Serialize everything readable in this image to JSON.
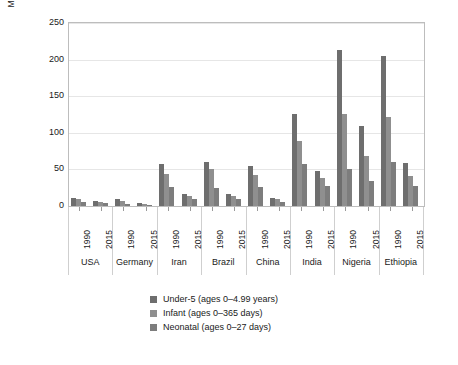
{
  "chart_data": {
    "type": "bar",
    "title": "",
    "subtitle": "",
    "xlabel": "",
    "ylabel": "Mortality rate per 1000 live births",
    "ylim": [
      0,
      250
    ],
    "yticks": [
      0,
      50,
      100,
      150,
      200,
      250
    ],
    "grid": true,
    "legend_position": "bottom",
    "grouping": "country-then-year",
    "categories": [
      "USA 1990",
      "USA 2015",
      "Germany 1990",
      "Germany 2015",
      "Iran 1990",
      "Iran 2015",
      "Brazil 1990",
      "Brazil 2015",
      "China 1990",
      "China 2015",
      "India 1990",
      "India 2015",
      "Nigeria 1990",
      "Nigeria 2015",
      "Ethiopia 1990",
      "Ethiopia 2015"
    ],
    "countries": [
      "USA",
      "Germany",
      "Iran",
      "Brazil",
      "China",
      "India",
      "Nigeria",
      "Ethiopia"
    ],
    "years": [
      "1990",
      "2015"
    ],
    "series": [
      {
        "name": "Under-5 (ages 0–4.99 years)",
        "color": "#6e6e6e",
        "values": [
          11,
          7,
          9,
          4,
          57,
          16,
          60,
          16,
          54,
          11,
          126,
          48,
          213,
          109,
          205,
          59
        ]
      },
      {
        "name": "Infant (ages 0–365 days)",
        "color": "#8f8f8f",
        "values": [
          9,
          6,
          7,
          3,
          44,
          13,
          50,
          14,
          42,
          9,
          89,
          38,
          126,
          69,
          122,
          41
        ]
      },
      {
        "name": "Neonatal (ages 0–27 days)",
        "color": "#7d7d7d",
        "values": [
          6,
          4,
          3,
          2,
          26,
          10,
          25,
          9,
          26,
          5,
          57,
          28,
          50,
          34,
          60,
          28
        ]
      }
    ]
  },
  "axis": {
    "y_title": "Mortality rate per 1000 live births",
    "y_tick_labels": [
      "250",
      "200",
      "150",
      "100",
      "50",
      "0"
    ]
  },
  "xaxis": {
    "groups": [
      {
        "country": "USA",
        "years": [
          "1990",
          "2015"
        ]
      },
      {
        "country": "Germany",
        "years": [
          "1990",
          "2015"
        ]
      },
      {
        "country": "Iran",
        "years": [
          "1990",
          "2015"
        ]
      },
      {
        "country": "Brazil",
        "years": [
          "1990",
          "2015"
        ]
      },
      {
        "country": "China",
        "years": [
          "1990",
          "2015"
        ]
      },
      {
        "country": "India",
        "years": [
          "1990",
          "2015"
        ]
      },
      {
        "country": "Nigeria",
        "years": [
          "1990",
          "2015"
        ]
      },
      {
        "country": "Ethiopia",
        "years": [
          "1990",
          "2015"
        ]
      }
    ]
  },
  "legend": {
    "items": [
      {
        "label": "Under-5 (ages 0–4.99 years)",
        "color": "#6e6e6e"
      },
      {
        "label": "Infant (ages 0–365 days)",
        "color": "#8f8f8f"
      },
      {
        "label": "Neonatal (ages 0–27 days)",
        "color": "#7d7d7d"
      }
    ]
  },
  "colors": {
    "under5": "#6e6e6e",
    "infant": "#8f8f8f",
    "neonatal": "#7d7d7d",
    "grid": "#e6e6e6",
    "frame": "#bdbdbd",
    "text": "#1a1a1a",
    "background": "#ffffff"
  }
}
